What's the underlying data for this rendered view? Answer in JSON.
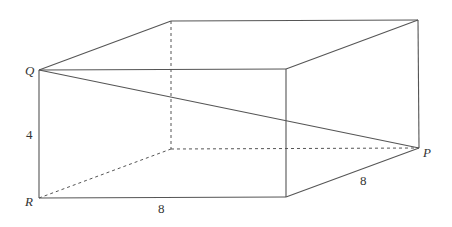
{
  "figure": {
    "vertices": {
      "Q": "Q",
      "R": "R",
      "P": "P"
    },
    "dimensions": {
      "height": "4",
      "length": "8",
      "depth": "8"
    },
    "colors": {
      "line": "#555555",
      "text": "#333333",
      "background": "#ffffff"
    }
  }
}
